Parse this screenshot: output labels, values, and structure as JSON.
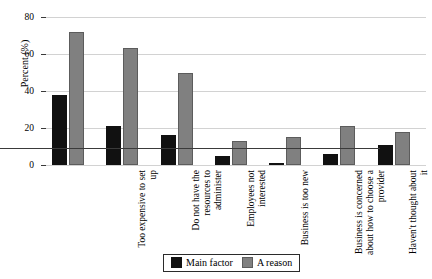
{
  "chart_data": {
    "type": "bar",
    "title": "",
    "xlabel": "",
    "ylabel": "Percent (%)",
    "ylim": [
      0,
      80
    ],
    "yticks": [
      0,
      20,
      40,
      60,
      80
    ],
    "grid": true,
    "legend_position": "bottom",
    "categories": [
      "Too expensive to set up",
      "Do not have the resources to administer",
      "Employees not interested",
      "Business is too new",
      "Business is concerned about how to choose a provider",
      "Haven't thought about it",
      "Other reason"
    ],
    "series": [
      {
        "name": "Main factor",
        "color": "#111111",
        "values": [
          38,
          21,
          16,
          5,
          1,
          6,
          11
        ]
      },
      {
        "name": "A reason",
        "color": "#808080",
        "values": [
          72,
          63,
          50,
          13,
          15,
          21,
          18
        ]
      }
    ]
  },
  "legend": {
    "items": [
      {
        "label": "Main factor",
        "swatch": "main-factor-swatch"
      },
      {
        "label": "A reason",
        "swatch": "a-reason-swatch"
      }
    ]
  }
}
